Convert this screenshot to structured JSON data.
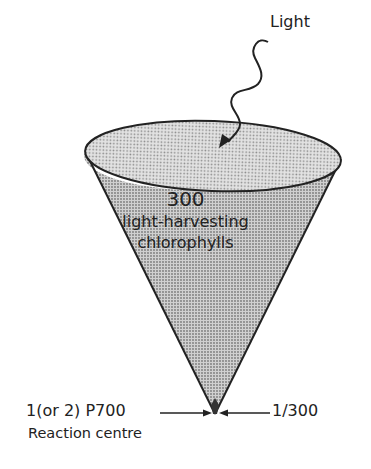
{
  "figure": {
    "light_label": "Light",
    "antenna": {
      "count": "300",
      "line1": "light-harvesting",
      "line2": "chlorophylls"
    },
    "reaction_centre": {
      "pigment_label": "1(or 2) P700",
      "caption": "Reaction centre"
    },
    "ratio_label": "1/300"
  },
  "colors": {
    "ink": "#222222",
    "cone_fill": "#bdbdbd",
    "top_fill": "#d6d6d6"
  }
}
